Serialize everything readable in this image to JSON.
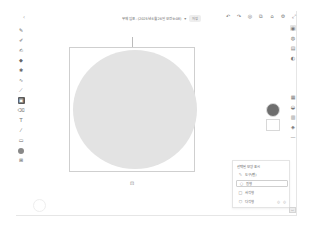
{
  "header": {
    "back_icon": "‹",
    "title": "무제 임포 - (2025년 6월 26일 오전 9:08)",
    "title_caret": "▾",
    "save_badge": "저장",
    "actions": [
      {
        "name": "undo-icon",
        "glyph": "↶"
      },
      {
        "name": "redo-icon",
        "glyph": "↷"
      },
      {
        "name": "timer-icon",
        "glyph": "◎"
      },
      {
        "name": "layers-icon",
        "glyph": "⧉"
      },
      {
        "name": "share-icon",
        "glyph": "⌂"
      },
      {
        "name": "settings-icon",
        "glyph": "⚙"
      },
      {
        "name": "expand-icon",
        "glyph": "⤢"
      }
    ]
  },
  "left_toolbar": {
    "tools": [
      {
        "name": "brush-tool",
        "glyph": "✎"
      },
      {
        "name": "pencil-tool",
        "glyph": "✐"
      },
      {
        "name": "marker-tool",
        "glyph": "✍"
      },
      {
        "name": "fill-tool",
        "glyph": "◆"
      },
      {
        "name": "stamp-tool",
        "glyph": "✱"
      },
      {
        "name": "curve-tool",
        "glyph": "∿"
      },
      {
        "name": "line-tool",
        "glyph": "⟋"
      },
      {
        "name": "shape-tool",
        "glyph": "▣",
        "active": true
      },
      {
        "name": "eraser-tool",
        "glyph": "⌫"
      },
      {
        "name": "text-tool",
        "glyph": "T"
      },
      {
        "name": "eyedropper-tool",
        "glyph": "⁄"
      },
      {
        "name": "ruler-tool",
        "glyph": "▭"
      },
      {
        "name": "color-tool",
        "glyph": "●"
      },
      {
        "name": "image-tool",
        "glyph": "⊞"
      }
    ]
  },
  "right_toolbar": {
    "top": [
      {
        "name": "layers-panel-icon",
        "glyph": "◉",
        "selected": true
      },
      {
        "name": "brush-settings-icon",
        "glyph": "◍"
      },
      {
        "name": "adjust-icon",
        "glyph": "▤"
      },
      {
        "name": "palette-icon",
        "glyph": "◐"
      }
    ],
    "bottom": [
      {
        "name": "grid-icon",
        "glyph": "▦"
      },
      {
        "name": "opacity-icon",
        "glyph": "◒"
      },
      {
        "name": "align-icon",
        "glyph": "▥"
      },
      {
        "name": "transform-icon",
        "glyph": "◈"
      },
      {
        "name": "minus-icon",
        "glyph": "—"
      }
    ]
  },
  "canvas": {
    "bottom_icon": "⊡"
  },
  "colors": {
    "fill": "#6e6e6e",
    "stroke": "#ffffff",
    "shape": "#e3e3e3"
  },
  "shape_panel": {
    "header": "선택된 모양 표시",
    "items": [
      {
        "label": "도구(펜)",
        "icon": "✎"
      },
      {
        "label": "원형",
        "icon": "○",
        "selected": true
      },
      {
        "label": "사각형",
        "icon": "□"
      },
      {
        "label": "다각형",
        "icon": "⬡",
        "extras": [
          "◎",
          "◎"
        ]
      }
    ]
  },
  "corner_button": "▭"
}
